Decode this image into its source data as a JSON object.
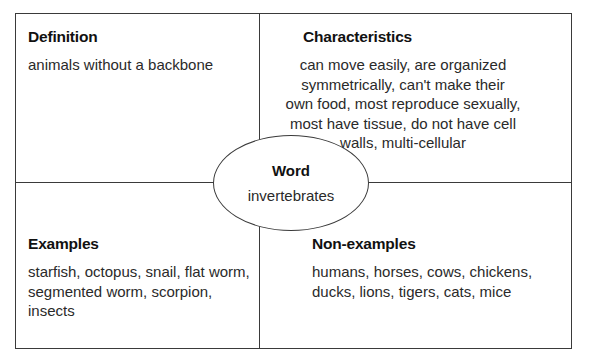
{
  "diagram": {
    "type": "frayer-model",
    "center": {
      "title": "Word",
      "value": "invertebrates"
    },
    "quadrants": {
      "definition": {
        "title": "Definition",
        "lines": [
          "animals without a backbone"
        ]
      },
      "characteristics": {
        "title": "Characteristics",
        "lines": [
          "can move easily, are organized",
          "symmetrically, can't make their",
          "own food, most reproduce sexually,",
          "most have tissue, do not have cell",
          "walls, multi-cellular"
        ]
      },
      "examples": {
        "title": "Examples",
        "lines": [
          "starfish, octopus, snail, flat worm,",
          "segmented worm, scorpion, insects"
        ]
      },
      "non_examples": {
        "title": "Non-examples",
        "lines": [
          "humans, horses, cows, chickens,",
          "ducks, lions, tigers, cats, mice"
        ]
      }
    },
    "colors": {
      "border": "#3a3a3a",
      "text": "#2a2a2a",
      "background": "#ffffff"
    }
  }
}
